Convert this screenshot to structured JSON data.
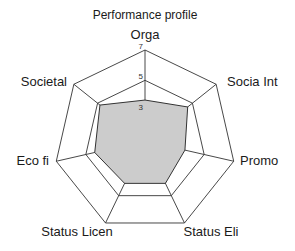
{
  "chart_data": {
    "type": "radar",
    "title": "Performance profile",
    "axes": [
      "Orga",
      "Socia Int",
      "Promo",
      "Status Eli",
      "Status Licen",
      "Eco fi",
      "Societal"
    ],
    "series": [
      {
        "name": "Performance",
        "values": [
          3.7,
          4.6,
          3.7,
          4.1,
          4.1,
          4.4,
          4.8
        ]
      }
    ],
    "range": [
      1,
      7
    ],
    "grid_rings": [
      5,
      7
    ],
    "tick_labels": [
      "3",
      "5",
      "7"
    ],
    "fill_color": "#cccccc",
    "line_color": "#333333",
    "grid": true,
    "legend": false
  }
}
